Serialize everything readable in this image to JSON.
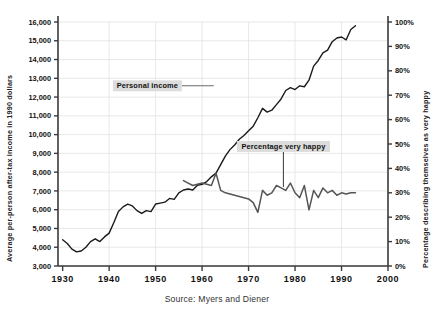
{
  "chart_data": {
    "type": "line",
    "title": "",
    "source_note": "Source: Myers and Diener",
    "xlabel": "",
    "xlim": [
      1929,
      2000
    ],
    "x_ticks": [
      "1930",
      "1940",
      "1950",
      "1960",
      "1970",
      "1980",
      "1990",
      "2000"
    ],
    "x_tick_values": [
      1930,
      1940,
      1950,
      1960,
      1970,
      1980,
      1990,
      2000
    ],
    "grid": true,
    "legend": "none",
    "axes": [
      {
        "id": "left",
        "ylabel": "Average per-person after-tax income in 1990 dollars",
        "ylim": [
          3000,
          16000
        ],
        "ticks": [
          "3,000",
          "4,000",
          "5,000",
          "6,000",
          "7,000",
          "8,000",
          "9,000",
          "10,000",
          "11,000",
          "12,000",
          "13,000",
          "14,000",
          "15,000",
          "16,000"
        ],
        "tick_values": [
          3000,
          4000,
          5000,
          6000,
          7000,
          8000,
          9000,
          10000,
          11000,
          12000,
          13000,
          14000,
          15000,
          16000
        ]
      },
      {
        "id": "right",
        "ylabel": "Percentage describing themselves as very happy",
        "ylim": [
          0,
          100
        ],
        "ticks": [
          "0%",
          "10%",
          "20%",
          "30%",
          "40%",
          "50%",
          "60%",
          "70%",
          "80%",
          "90%",
          "100%"
        ],
        "tick_values": [
          0,
          10,
          20,
          30,
          40,
          50,
          60,
          70,
          80,
          90,
          100
        ]
      }
    ],
    "series": [
      {
        "name": "Personal income",
        "axis": "left",
        "color": "#1a1a1a",
        "units": "1990 dollars",
        "x": [
          1930,
          1931,
          1932,
          1933,
          1934,
          1935,
          1936,
          1937,
          1938,
          1939,
          1940,
          1941,
          1942,
          1943,
          1944,
          1945,
          1946,
          1947,
          1948,
          1949,
          1950,
          1951,
          1952,
          1953,
          1954,
          1955,
          1956,
          1957,
          1958,
          1959,
          1960,
          1961,
          1962,
          1963,
          1964,
          1965,
          1966,
          1967,
          1968,
          1969,
          1970,
          1971,
          1972,
          1973,
          1974,
          1975,
          1976,
          1977,
          1978,
          1979,
          1980,
          1981,
          1982,
          1983,
          1984,
          1985,
          1986,
          1987,
          1988,
          1989,
          1990,
          1991,
          1992,
          1993
        ],
        "y": [
          4400,
          4200,
          3900,
          3750,
          3800,
          4000,
          4300,
          4450,
          4300,
          4550,
          4750,
          5300,
          5900,
          6150,
          6300,
          6200,
          5950,
          5800,
          5950,
          5900,
          6300,
          6350,
          6400,
          6600,
          6550,
          6900,
          7050,
          7100,
          7050,
          7300,
          7350,
          7500,
          7750,
          7950,
          8400,
          8850,
          9200,
          9450,
          9750,
          9950,
          10200,
          10450,
          10900,
          11400,
          11200,
          11300,
          11600,
          11900,
          12350,
          12500,
          12400,
          12600,
          12550,
          12900,
          13650,
          13950,
          14350,
          14500,
          14950,
          15150,
          15200,
          15050,
          15600,
          15800
        ]
      },
      {
        "name": "Percentage very happy",
        "axis": "right",
        "color": "#555555",
        "units": "percent",
        "x": [
          1956,
          1957,
          1958,
          1959,
          1960,
          1961,
          1962,
          1963,
          1964,
          1965,
          1966,
          1967,
          1968,
          1969,
          1970,
          1971,
          1972,
          1973,
          1974,
          1975,
          1976,
          1977,
          1978,
          1979,
          1980,
          1981,
          1982,
          1983,
          1984,
          1985,
          1986,
          1987,
          1988,
          1989,
          1990,
          1991,
          1992,
          1993
        ],
        "y": [
          35,
          34,
          33,
          33.5,
          34,
          33.5,
          33,
          38,
          31,
          30,
          29.5,
          29,
          28.5,
          28,
          27.5,
          26,
          22,
          31,
          29,
          30,
          33,
          32,
          31,
          34,
          30,
          28,
          33,
          23,
          31,
          28,
          32,
          30,
          31,
          29,
          30,
          29.5,
          30,
          30
        ]
      }
    ],
    "annotations": [
      {
        "label": "Personal income",
        "x": 1959.5,
        "y_axis": "left",
        "y_value": 12600
      },
      {
        "label": "Percentage very happy",
        "x": 1977.5,
        "y_axis": "right",
        "y_value": 49
      }
    ]
  }
}
